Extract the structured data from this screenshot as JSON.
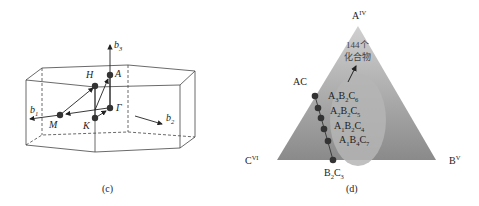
{
  "panel_c": {
    "caption": "(c)",
    "axes": {
      "b1": "b",
      "b1_sub": "1",
      "b2": "b",
      "b2_sub": "2",
      "b3": "b",
      "b3_sub": "3"
    },
    "points": {
      "H": "H",
      "A": "A",
      "M": "M",
      "K": "K",
      "Gamma": "Γ"
    }
  },
  "panel_d": {
    "caption": "(d)",
    "vertices": {
      "top": "A",
      "top_sup": "IV",
      "left": "C",
      "left_sup": "VI",
      "right": "B",
      "right_sup": "V"
    },
    "ac_label": "AC",
    "b2c3": {
      "b": "B",
      "b_sub": "2",
      "c": "C",
      "c_sub": "3"
    },
    "count_label_line1": "144个",
    "count_label_line2": "化合物",
    "compounds": [
      {
        "a": "A",
        "a_sub": "3",
        "b": "B",
        "b_sub": "2",
        "c": "C",
        "c_sub": "6"
      },
      {
        "a": "A",
        "a_sub": "2",
        "b": "B",
        "b_sub": "2",
        "c": "C",
        "c_sub": "5"
      },
      {
        "a": "A",
        "a_sub": "1",
        "b": "B",
        "b_sub": "2",
        "c": "C",
        "c_sub": "4"
      },
      {
        "a": "A",
        "a_sub": "1",
        "b": "B",
        "b_sub": "4",
        "c": "C",
        "c_sub": "7"
      }
    ],
    "colors": {
      "triangle_top": "#c9c9c9",
      "triangle_bottom": "#8e8e8e",
      "ellipse": "#b3b3b3",
      "dots": "#333333"
    }
  }
}
